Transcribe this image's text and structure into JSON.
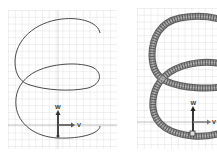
{
  "figure": {
    "panels": [
      {
        "id": "left",
        "style": "thin-line helix",
        "axes": {
          "vertical_label": "W",
          "horizontal_label": "V"
        }
      },
      {
        "id": "right",
        "style": "tube helix",
        "axes": {
          "vertical_label": "W",
          "horizontal_label": "V"
        }
      }
    ],
    "colors": {
      "background": "#ffffff",
      "grid": "#cfcfcf",
      "curve": "#4a4a4a",
      "tube": "#7a7a7a",
      "arrow": "#333333"
    }
  }
}
